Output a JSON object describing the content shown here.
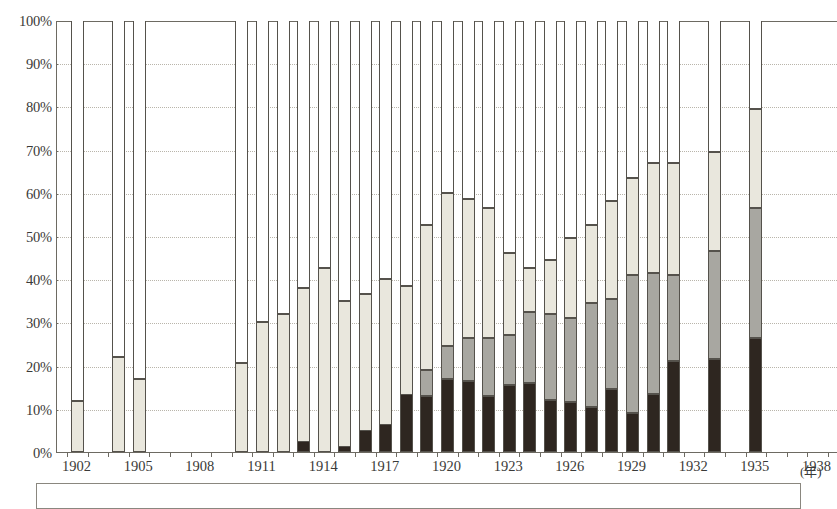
{
  "chart_data": {
    "type": "bar",
    "stacked": true,
    "title": "",
    "subtitle": "",
    "xlabel": "(年)",
    "ylabel": "",
    "ylim": [
      0,
      100
    ],
    "y_unit": "%",
    "grid": true,
    "legend_position": "none",
    "x_tick_labels": [
      "1902",
      "1905",
      "1908",
      "1911",
      "1914",
      "1917",
      "1920",
      "1923",
      "1926",
      "1929",
      "1932",
      "1935",
      "1938"
    ],
    "y_tick_labels": [
      "0%",
      "10%",
      "20%",
      "30%",
      "40%",
      "50%",
      "60%",
      "70%",
      "80%",
      "90%",
      "100%"
    ],
    "y_ticks": [
      0,
      10,
      20,
      30,
      40,
      50,
      60,
      70,
      80,
      90,
      100
    ],
    "x_range": [
      1901,
      1939
    ],
    "categories": [
      1902,
      1903,
      1904,
      1905,
      1906,
      1907,
      1908,
      1909,
      1910,
      1911,
      1912,
      1913,
      1914,
      1915,
      1916,
      1917,
      1918,
      1919,
      1920,
      1921,
      1922,
      1923,
      1924,
      1925,
      1926,
      1927,
      1928,
      1929,
      1930,
      1931,
      1932,
      1933,
      1934,
      1935,
      1936,
      1937,
      1938
    ],
    "series": [
      {
        "name": "series-a-dark",
        "color": "#2e2620",
        "values": [
          0,
          null,
          0,
          0,
          null,
          null,
          null,
          null,
          0,
          0,
          0,
          2.5,
          0,
          1.5,
          5.0,
          6.5,
          13.5,
          13.0,
          17.0,
          16.5,
          13.0,
          15.5,
          16.0,
          12.0,
          11.5,
          10.5,
          14.5,
          9.0,
          13.5,
          21.0,
          null,
          21.5,
          null,
          26.5,
          null,
          null,
          null
        ]
      },
      {
        "name": "series-b-grey",
        "color": "#a8a7a1",
        "values": [
          0,
          null,
          0,
          0,
          null,
          null,
          null,
          null,
          0,
          0,
          0,
          0,
          0,
          0.5,
          0,
          4.5,
          5.5,
          19.0,
          24.5,
          26.5,
          26.5,
          27.0,
          32.5,
          32.0,
          31.0,
          34.5,
          35.5,
          41.0,
          41.5,
          41.0,
          null,
          46.5,
          null,
          56.5,
          null,
          null,
          null
        ]
      },
      {
        "name": "series-c-light",
        "color": "#e9e7dd",
        "values": [
          11.8,
          null,
          22.0,
          16.8,
          null,
          null,
          null,
          null,
          20.5,
          30.0,
          32.0,
          38.0,
          42.5,
          35.0,
          36.5,
          40.0,
          38.5,
          52.5,
          60.0,
          58.5,
          56.5,
          46.0,
          42.5,
          44.5,
          49.5,
          52.5,
          58.0,
          63.5,
          67.0,
          67.0,
          null,
          69.5,
          null,
          79.5,
          null,
          null,
          null
        ]
      }
    ],
    "missing_years": [
      1903,
      1906,
      1907,
      1908,
      1909,
      1932,
      1934,
      1936,
      1937,
      1938
    ]
  },
  "axis": {
    "unit_label": "(年)"
  }
}
